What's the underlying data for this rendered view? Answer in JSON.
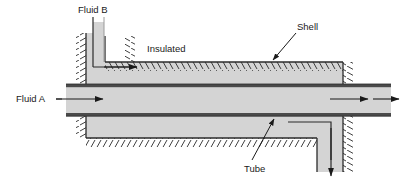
{
  "figure": {
    "name": "shell-and-tube-heat-exchanger-diagram",
    "width": 403,
    "height": 183,
    "background_color": "#ffffff"
  },
  "colors": {
    "fill_gray": "#d4d4d4",
    "shell_gray": "#cfcfcf",
    "line_dark": "#2b2b2b",
    "line_mid": "#555555",
    "text": "#1a1a1a",
    "white": "#ffffff"
  },
  "labels": {
    "fluid_b": "Fluid B",
    "fluid_a": "Fluid A",
    "insulated": "Insulated",
    "shell": "Shell",
    "tube": "Tube"
  },
  "annotations": [
    {
      "id": "fluid-b",
      "text": "Fluid B",
      "x": 78,
      "y": 13,
      "anchor": "start"
    },
    {
      "id": "fluid-a",
      "text": "Fluid A",
      "x": 18,
      "y": 101,
      "anchor": "start"
    },
    {
      "id": "insulated",
      "text": "Insulated",
      "x": 147,
      "y": 51,
      "anchor": "start"
    },
    {
      "id": "shell",
      "text": "Shell",
      "x": 298,
      "y": 30,
      "anchor": "start"
    },
    {
      "id": "tube",
      "text": "Tube",
      "x": 246,
      "y": 172,
      "anchor": "start"
    }
  ],
  "flow_arrows": [
    {
      "id": "fluid-b-inlet-arrow",
      "direction": "right",
      "description": "shell-side fluid B entering at top left"
    },
    {
      "id": "fluid-a-inlet-arrow",
      "direction": "right",
      "description": "tube-side fluid A entering at left"
    },
    {
      "id": "fluid-a-internal-arrow",
      "direction": "right",
      "description": "tube-side fluid A flowing through tube"
    },
    {
      "id": "fluid-a-outlet-arrow",
      "direction": "right",
      "description": "tube-side fluid A leaving at right"
    },
    {
      "id": "fluid-b-outlet-arrow",
      "direction": "down",
      "description": "shell-side fluid B leaving at bottom right"
    }
  ],
  "leader_lines": [
    {
      "id": "shell-leader",
      "from": [
        296,
        33
      ],
      "to": [
        272,
        60
      ],
      "has_arrowhead": true
    },
    {
      "id": "tube-leader",
      "from": [
        252,
        162
      ],
      "to": [
        273,
        120
      ],
      "has_arrowhead": true
    },
    {
      "id": "fluid-a-leader",
      "from": [
        56,
        98
      ],
      "to": [
        76,
        98
      ],
      "has_arrowhead": false
    },
    {
      "id": "fluid-b-leader",
      "from": [
        98,
        17
      ],
      "to": [
        98,
        52
      ],
      "has_arrowhead": false
    }
  ]
}
